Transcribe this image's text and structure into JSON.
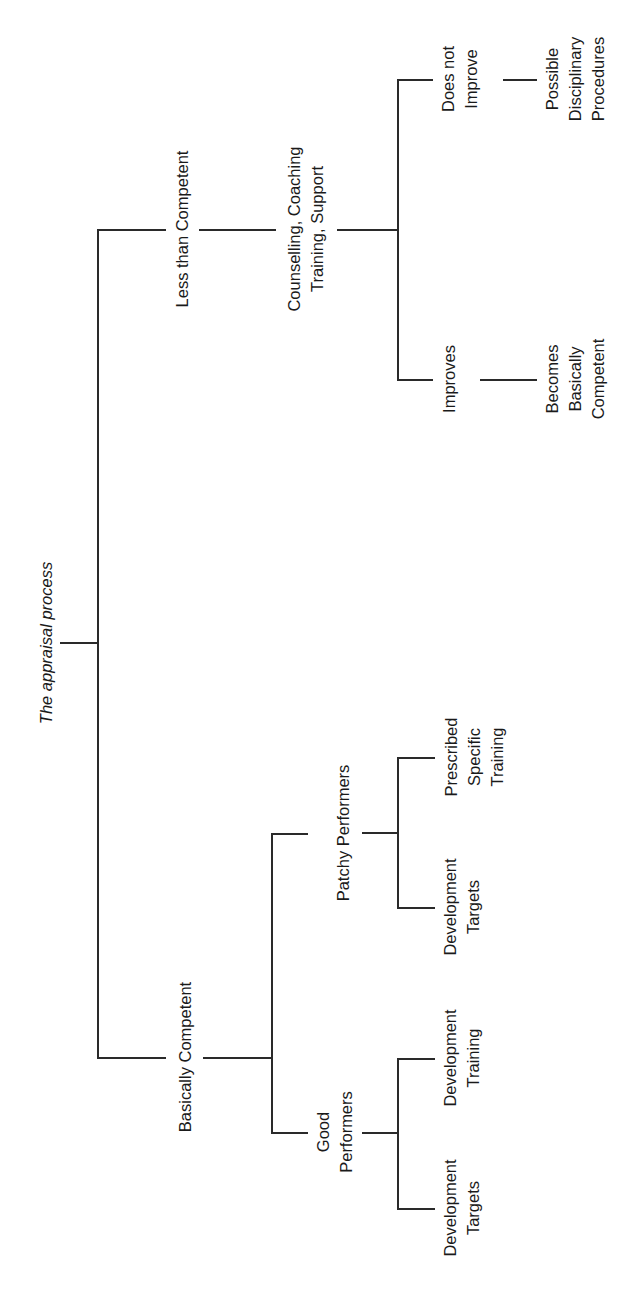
{
  "diagram": {
    "type": "tree",
    "orientation": "rotated-90-ccw",
    "root": {
      "label": "The appraisal process",
      "children": [
        {
          "label": "Less than Competent",
          "children": [
            {
              "label": "Counselling, Coaching\nTraining, Support",
              "children": [
                {
                  "label": "Improves",
                  "children": [
                    {
                      "label": "Becomes\nBasically\nCompetent"
                    }
                  ]
                },
                {
                  "label": "Does not\nImprove",
                  "children": [
                    {
                      "label": "Possible\nDisciplinary\nProcedures"
                    }
                  ]
                }
              ]
            }
          ]
        },
        {
          "label": "Basically Competent",
          "children": [
            {
              "label": "Good\nPerformers",
              "children": [
                {
                  "label": "Development\nTargets"
                },
                {
                  "label": "Development\nTraining"
                }
              ]
            },
            {
              "label": "Patchy Performers",
              "children": [
                {
                  "label": "Development\nTargets"
                },
                {
                  "label": "Prescribed\nSpecific\nTraining"
                }
              ]
            }
          ]
        }
      ]
    }
  },
  "labels": {
    "root": "The appraisal process",
    "less_than_competent": "Less than Competent",
    "counselling": "Counselling, Coaching\nTraining, Support",
    "does_not_improve": "Does not\nImprove",
    "possible_disciplinary": "Possible\nDisciplinary\nProcedures",
    "improves": "Improves",
    "becomes_competent": "Becomes\nBasically\nCompetent",
    "basically_competent": "Basically Competent",
    "patchy_performers": "Patchy Performers",
    "prescribed_training": "Prescribed\nSpecific\nTraining",
    "patchy_dev_targets": "Development\nTargets",
    "good_performers": "Good\nPerformers",
    "good_dev_training": "Development\nTraining",
    "good_dev_targets": "Development\nTargets"
  },
  "colors": {
    "line": "#2a2a2a",
    "text": "#1a1a1a",
    "background": "#ffffff"
  }
}
